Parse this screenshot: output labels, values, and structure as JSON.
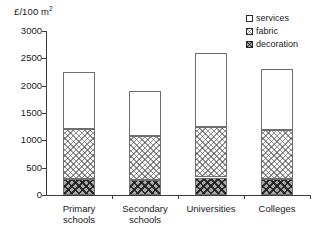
{
  "chart_data": {
    "type": "bar",
    "subtype": "stacked",
    "title": "",
    "xlabel": "",
    "ylabel": "£/100 m2",
    "ylabel_display": "£/100 m",
    "ylabel_superscript": "2",
    "ylim": [
      0,
      3000
    ],
    "ytick_values": [
      0,
      500,
      1000,
      1500,
      2000,
      2500,
      3000
    ],
    "ytick_labels": [
      "0",
      "500",
      "1000",
      "1500",
      "2000",
      "2500",
      "3000"
    ],
    "grid": false,
    "legend_position": "top-right",
    "categories": [
      "Primary schools",
      "Secondary schools",
      "Universities",
      "Colleges"
    ],
    "category_lines": [
      [
        "Primary",
        "schools"
      ],
      [
        "Secondary",
        "schools"
      ],
      [
        "Universities",
        ""
      ],
      [
        "Colleges",
        ""
      ]
    ],
    "series": [
      {
        "name": "decoration",
        "values": [
          300,
          280,
          320,
          290
        ],
        "fill": "dark-crosshatch"
      },
      {
        "name": "fabric",
        "values": [
          900,
          800,
          930,
          890
        ],
        "fill": "light-crosshatch"
      },
      {
        "name": "services",
        "values": [
          1050,
          820,
          1350,
          1120
        ],
        "fill": "white"
      }
    ],
    "cumulative_tops": {
      "decoration": [
        300,
        280,
        320,
        290
      ],
      "fabric": [
        1200,
        1080,
        1250,
        1180
      ],
      "services": [
        2250,
        1900,
        2600,
        2300
      ]
    },
    "totals": [
      2250,
      1900,
      2600,
      2300
    ]
  },
  "legend": {
    "items": [
      {
        "label": "services",
        "swatch": "white-box-icon"
      },
      {
        "label": "fabric",
        "swatch": "hatched-box-icon"
      },
      {
        "label": "decoration",
        "swatch": "dark-hatched-box-icon"
      }
    ]
  },
  "colors": {
    "axis": "#3a3a3a",
    "bar_outline": "#6e6e6e",
    "services_fill": "#ffffff",
    "fabric_fill": "#fbfbfb",
    "decoration_fill": "#a8a8a8",
    "text": "#1a1a1a",
    "background": "#ffffff"
  }
}
